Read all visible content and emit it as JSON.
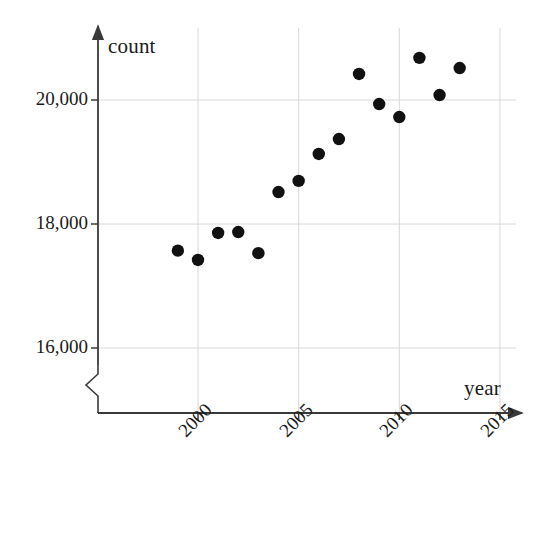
{
  "chart_data": {
    "type": "scatter",
    "title": "",
    "xlabel": "year",
    "ylabel": "count",
    "xlim": [
      1996.0,
      2016.0
    ],
    "ylim": [
      15500,
      21200
    ],
    "xticks": [
      "2000",
      "2005",
      "2010",
      "2015"
    ],
    "xtick_values": [
      2000,
      2005,
      2010,
      2015
    ],
    "yticks": [
      "16,000",
      "18,000",
      "20,000"
    ],
    "ytick_values": [
      16000,
      18000,
      20000
    ],
    "grid": true,
    "legend": false,
    "axis_break": true,
    "marker": "filled-circle",
    "marker_color": "#111111",
    "x": [
      1999,
      2000,
      2001,
      2002,
      2003,
      2004,
      2005,
      2006,
      2007,
      2008,
      2009,
      2010,
      2011,
      2012,
      2013
    ],
    "values": [
      17570,
      17420,
      17855,
      17870,
      17530,
      18515,
      18695,
      19130,
      19370,
      20420,
      19935,
      19725,
      20680,
      20080,
      20515
    ],
    "points": [
      {
        "year": 1999,
        "count": 17570
      },
      {
        "year": 2000,
        "count": 17420
      },
      {
        "year": 2001,
        "count": 17855
      },
      {
        "year": 2002,
        "count": 17870
      },
      {
        "year": 2003,
        "count": 17530
      },
      {
        "year": 2004,
        "count": 18515
      },
      {
        "year": 2005,
        "count": 18695
      },
      {
        "year": 2006,
        "count": 19130
      },
      {
        "year": 2007,
        "count": 19370
      },
      {
        "year": 2008,
        "count": 20420
      },
      {
        "year": 2009,
        "count": 19935
      },
      {
        "year": 2010,
        "count": 19725
      },
      {
        "year": 2011,
        "count": 20680
      },
      {
        "year": 2012,
        "count": 20080
      },
      {
        "year": 2013,
        "count": 20515
      }
    ]
  },
  "axes": {
    "y_title": "count",
    "x_title": "year"
  },
  "colors": {
    "marker": "#111111",
    "axis": "#3a3a3a",
    "grid": "#d8d8d8",
    "text": "#1a1a1a",
    "background": "#ffffff"
  }
}
